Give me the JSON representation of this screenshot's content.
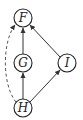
{
  "diagram": {
    "type": "directed-graph",
    "nodes": [
      {
        "id": "F",
        "label": "F",
        "x": 23,
        "y": 18
      },
      {
        "id": "G",
        "label": "G",
        "x": 23,
        "y": 63
      },
      {
        "id": "I",
        "label": "I",
        "x": 67,
        "y": 63
      },
      {
        "id": "H",
        "label": "H",
        "x": 23,
        "y": 108
      }
    ],
    "edges": [
      {
        "from": "H",
        "to": "G",
        "style": "solid"
      },
      {
        "from": "G",
        "to": "F",
        "style": "solid"
      },
      {
        "from": "H",
        "to": "I",
        "style": "solid"
      },
      {
        "from": "I",
        "to": "F",
        "style": "solid"
      },
      {
        "from": "H",
        "to": "F",
        "style": "dashed",
        "curved": true
      }
    ]
  }
}
